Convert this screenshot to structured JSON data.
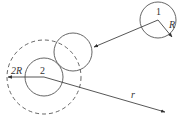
{
  "diagram": {
    "type": "geometry",
    "stroke_color": "#4a4a4a",
    "labels": {
      "particle1": "1",
      "particle2": "2",
      "radius": "R",
      "double_radius": "2R",
      "distance": "r"
    },
    "circles": [
      {
        "id": "particle-1",
        "cx": 158,
        "cy": 20,
        "r": 18,
        "style": "solid"
      },
      {
        "id": "moved-particle",
        "cx": 73,
        "cy": 52,
        "r": 19,
        "style": "solid"
      },
      {
        "id": "particle-2",
        "cx": 44,
        "cy": 77,
        "r": 19,
        "style": "solid"
      },
      {
        "id": "exclusion-sphere",
        "cx": 44,
        "cy": 77,
        "r": 37,
        "style": "dashed"
      }
    ],
    "arrows": [
      {
        "id": "trajectory-arrow",
        "from": [
          158,
          20
        ],
        "to": [
          94,
          47
        ]
      },
      {
        "id": "radius-arrow",
        "from": [
          158,
          20
        ],
        "to": [
          172,
          37
        ]
      },
      {
        "id": "double-radius-arrow",
        "from": [
          44,
          77
        ],
        "to": [
          8,
          77
        ]
      },
      {
        "id": "distance-arrow",
        "from": [
          44,
          77
        ],
        "to": [
          165,
          112
        ]
      }
    ]
  }
}
